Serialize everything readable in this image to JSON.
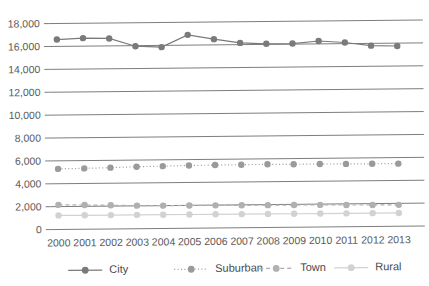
{
  "chart_data": {
    "type": "line",
    "title": "",
    "xlabel": "",
    "ylabel": "",
    "ylim": [
      0,
      18000
    ],
    "ytick_step": 2000,
    "grid": true,
    "legend_position": "bottom",
    "categories": [
      "2000",
      "2001",
      "2002",
      "2003",
      "2004",
      "2005",
      "2006",
      "2007",
      "2008",
      "2009",
      "2010",
      "2011",
      "2012",
      "2013"
    ],
    "ytick_labels": [
      "18,000",
      "16,000",
      "14,000",
      "12,000",
      "10,000",
      "8,000",
      "6,000",
      "4,000",
      "2,000",
      "0"
    ],
    "ytick_values": [
      18000,
      16000,
      14000,
      12000,
      10000,
      8000,
      6000,
      4000,
      2000,
      0
    ],
    "series": [
      {
        "name": "City",
        "color": "#7a7a7a",
        "line_style": "solid",
        "marker": "circle",
        "values": [
          16600,
          16700,
          16650,
          15950,
          15850,
          16900,
          16500,
          16150,
          16050,
          16050,
          16250,
          16100,
          15800,
          15750
        ]
      },
      {
        "name": "Suburban",
        "color": "#9a9a9a",
        "line_style": "dotted",
        "marker": "circle",
        "values": [
          5300,
          5320,
          5360,
          5420,
          5450,
          5480,
          5500,
          5510,
          5520,
          5500,
          5500,
          5490,
          5480,
          5470
        ]
      },
      {
        "name": "Town",
        "color": "#b0b0b0",
        "line_style": "dashed",
        "marker": "circle",
        "values": [
          2150,
          2120,
          2080,
          2020,
          2000,
          1990,
          1980,
          1960,
          1950,
          1940,
          1930,
          1900,
          1880,
          1870
        ]
      },
      {
        "name": "Rural",
        "color": "#d2d2d2",
        "line_style": "solid",
        "marker": "circle",
        "values": [
          1230,
          1220,
          1215,
          1210,
          1205,
          1200,
          1195,
          1190,
          1185,
          1180,
          1175,
          1170,
          1165,
          1160
        ]
      }
    ]
  },
  "legend": {
    "items": [
      {
        "label": "City"
      },
      {
        "label": "Suburban"
      },
      {
        "label": "Town"
      },
      {
        "label": "Rural"
      }
    ]
  }
}
